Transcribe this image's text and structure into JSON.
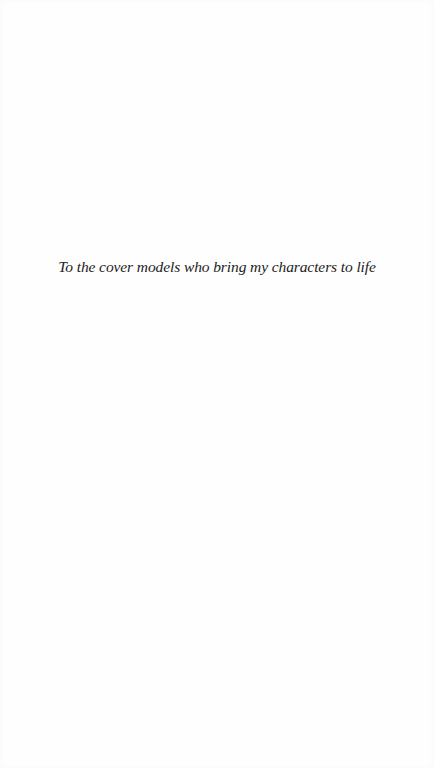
{
  "page": {
    "type": "dedication",
    "dedication_text": "To the cover models who bring my characters to life"
  },
  "colors": {
    "background": "#fefefe",
    "text": "#222222"
  }
}
